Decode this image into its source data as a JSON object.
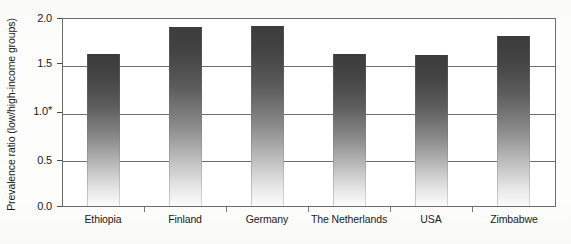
{
  "chart_data": {
    "type": "bar",
    "title": "",
    "xlabel": "",
    "ylabel": "Prevalence ratio (low/high-income groups)",
    "categories": [
      "Ethiopia",
      "Finland",
      "Germany",
      "The Netherlands",
      "USA",
      "Zimbabwe"
    ],
    "values": [
      1.61,
      1.89,
      1.9,
      1.61,
      1.6,
      1.8
    ],
    "ylim": [
      0.0,
      2.0
    ],
    "ytick_labels": [
      "0.0",
      "0.5",
      "1.0*",
      "1.5",
      "2.0"
    ],
    "ytick_values": [
      0.0,
      0.5,
      1.0,
      1.5,
      2.0
    ],
    "grid": true,
    "gridlines_at": [
      0.5,
      1.0,
      1.5,
      2.0
    ],
    "legend": "none",
    "reference_note": "1.0*",
    "bar_style": {
      "fill_top_color": "#3c3c3c",
      "fill_bottom_color": "#fbfbfb",
      "gradient_direction": "top-dark-to-bottom-light"
    },
    "axis_color": "#6b6b6b",
    "background_color": "#fdfdfc"
  }
}
